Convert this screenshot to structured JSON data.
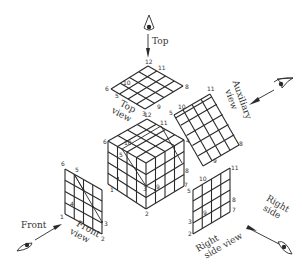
{
  "diagram": {
    "type": "orthographic-projection-of-cube",
    "colors": {
      "line": "#2a2a2a",
      "text": "#333333",
      "background": "#ffffff"
    },
    "directions": [
      {
        "id": "top",
        "label": "Top",
        "icon": "eye-icon"
      },
      {
        "id": "auxiliary",
        "label_line1": "Auxiliary",
        "label_line2": "view",
        "icon": "eye-icon"
      },
      {
        "id": "front",
        "label": "Front",
        "icon": "eye-icon"
      },
      {
        "id": "right",
        "label_line1": "Right",
        "label_line2": "side",
        "icon": "eye-icon"
      }
    ],
    "views": {
      "top_view": {
        "label_line1": "Top",
        "label_line2": "view",
        "vertex_labels": [
          "12",
          "11",
          "6",
          "10",
          "5",
          "8",
          "3",
          "9"
        ]
      },
      "auxiliary_view": {
        "vertex_labels": [
          "11",
          "10",
          "5",
          "8",
          "9"
        ]
      },
      "cube": {
        "vertex_labels": [
          "12",
          "11",
          "6",
          "10",
          "5",
          "4",
          "8",
          "1",
          "3",
          "9",
          "7",
          "2"
        ]
      },
      "front_view": {
        "label_line1": "Front",
        "label_line2": "view",
        "vertex_labels": [
          "6",
          "5",
          "4",
          "1",
          "3",
          "2"
        ]
      },
      "right_side_view": {
        "label_line1": "Right",
        "label_line2": "side view",
        "vertex_labels": [
          "11",
          "10",
          "5",
          "8",
          "7",
          "3",
          "9",
          "2"
        ]
      }
    }
  }
}
